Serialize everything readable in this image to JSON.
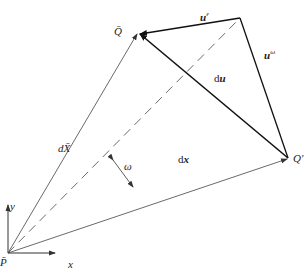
{
  "labels": {
    "Q_bar": "Q̄",
    "Q_prime": "Q′",
    "P_bar": "P̄",
    "u_eps_base": "u",
    "u_eps_sup": "ε",
    "u_omega_base": "u",
    "u_omega_sup": "ω",
    "du_d": "d",
    "du_u": "u",
    "dX": "dX̄",
    "dx_d": "d",
    "dx_x": "x",
    "omega": "ω",
    "axis_x": "x",
    "axis_y": "y"
  },
  "colors": {
    "line": "#333333",
    "thick": "#111111"
  }
}
